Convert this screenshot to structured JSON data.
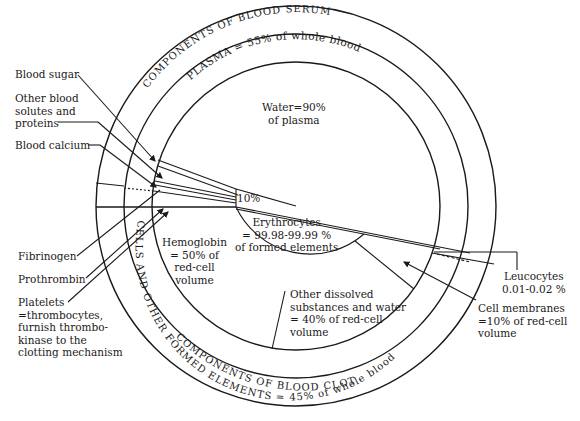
{
  "diagram": {
    "type": "concentric-circle composition diagram",
    "subject": "Components of blood",
    "rings": {
      "outer_top": "COMPONENTS OF BLOOD SERUM",
      "outer_bottom": "COMPONENTS OF BLOOD CLOT",
      "middle_top": "PLASMA = 55% of whole blood",
      "middle_bottom": "CELLS AND OTHER FORMED ELEMENTS = 45% of whole blood"
    },
    "center_labels": {
      "water": "Water=90%\nof plasma",
      "ten_percent": "10%",
      "erythrocytes": "Erythrocytes\n= 99.98-99.99 %\nof formed elements",
      "hemoglobin": "Hemoglobin\n= 50% of\nred-cell\nvolume",
      "other_dissolved": "Other dissolved\nsubstances and water\n= 40% of red-cell\nvolume"
    },
    "left_callouts": [
      {
        "id": "blood-sugar",
        "label": "Blood sugar"
      },
      {
        "id": "other-solutes",
        "label": "Other blood\nsolutes and\nproteins"
      },
      {
        "id": "blood-calcium",
        "label": "Blood calcium"
      },
      {
        "id": "fibrinogen",
        "label": "Fibrinogen"
      },
      {
        "id": "prothrombin",
        "label": "Prothrombin"
      },
      {
        "id": "platelets",
        "label": "Platelets\n=thrombocytes,\nfurnish thrombo-\nkinase to the\nclotting mechanism"
      }
    ],
    "right_callouts": [
      {
        "id": "leucocytes",
        "label": "Leucocytes\n0.01-0.02 %"
      },
      {
        "id": "cell-membranes",
        "label": "Cell membranes\n=10% of red-cell\nvolume"
      }
    ],
    "colors": {
      "line": "#1a1a1a",
      "background": "#ffffff"
    }
  }
}
